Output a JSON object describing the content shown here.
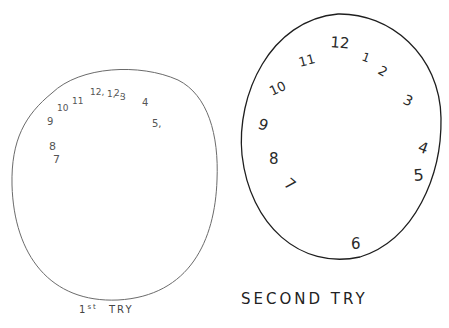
{
  "drawings": [
    {
      "id": "first",
      "label": "1st TRY",
      "label_main": "1",
      "label_sup": "st",
      "label_rest": "TRY",
      "numbers": [
        {
          "text": "9",
          "x": 47,
          "y": 125,
          "size": 10
        },
        {
          "text": "10",
          "x": 57,
          "y": 111,
          "size": 9
        },
        {
          "text": "11",
          "x": 72,
          "y": 104,
          "size": 9
        },
        {
          "text": "12,",
          "x": 90,
          "y": 95,
          "size": 9
        },
        {
          "text": "1,",
          "x": 107,
          "y": 97,
          "size": 9
        },
        {
          "text": "2,",
          "x": 114,
          "y": 96,
          "size": 9
        },
        {
          "text": "3",
          "x": 120,
          "y": 100,
          "size": 9
        },
        {
          "text": "4",
          "x": 142,
          "y": 106,
          "size": 10
        },
        {
          "text": "5,",
          "x": 152,
          "y": 127,
          "size": 10
        },
        {
          "text": "8",
          "x": 49,
          "y": 150,
          "size": 11
        },
        {
          "text": "7",
          "x": 53,
          "y": 163,
          "size": 11
        }
      ]
    },
    {
      "id": "second",
      "label": "SECOND TRY",
      "numbers": [
        {
          "text": "12",
          "x": 330,
          "y": 47,
          "size": 15,
          "rotate": 5
        },
        {
          "text": "1",
          "x": 361,
          "y": 60,
          "size": 12,
          "rotate": 20
        },
        {
          "text": "2",
          "x": 377,
          "y": 73,
          "size": 13,
          "rotate": 30
        },
        {
          "text": "3",
          "x": 402,
          "y": 103,
          "size": 14,
          "rotate": 25
        },
        {
          "text": "4",
          "x": 417,
          "y": 151,
          "size": 15,
          "rotate": 20
        },
        {
          "text": "5",
          "x": 414,
          "y": 181,
          "size": 16,
          "rotate": -5
        },
        {
          "text": "6",
          "x": 351,
          "y": 249,
          "size": 15,
          "rotate": 0
        },
        {
          "text": "7",
          "x": 283,
          "y": 185,
          "size": 15,
          "rotate": 40
        },
        {
          "text": "8",
          "x": 269,
          "y": 164,
          "size": 15,
          "rotate": 0
        },
        {
          "text": "9",
          "x": 257,
          "y": 128,
          "size": 15,
          "rotate": 20
        },
        {
          "text": "10",
          "x": 272,
          "y": 96,
          "size": 13,
          "rotate": -25
        },
        {
          "text": "11",
          "x": 300,
          "y": 67,
          "size": 13,
          "rotate": -15
        }
      ]
    }
  ]
}
